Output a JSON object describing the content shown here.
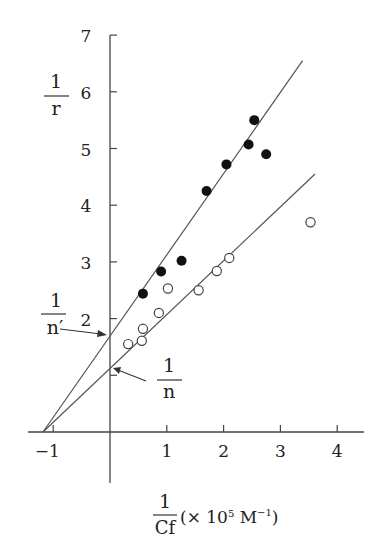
{
  "chart_data": {
    "type": "scatter",
    "title": "",
    "xlabel": "1/Cf (× 10^5 M^-1)",
    "xlabel_parts": {
      "numerator": "1",
      "denominator": "Cf",
      "unit": "(× 10",
      "exp": "5",
      "unit_tail": " M",
      "unit_exp": "−1",
      "close": ")"
    },
    "ylabel": "1/r",
    "ylabel_parts": {
      "numerator": "1",
      "denominator": "r"
    },
    "xlim": [
      -1.3,
      4.5
    ],
    "ylim": [
      0,
      7
    ],
    "x_ticks": [
      -1,
      1,
      2,
      3,
      4
    ],
    "x_tick_labels": [
      "−1",
      "1",
      "2",
      "3",
      "4"
    ],
    "y_ticks": [
      1,
      2,
      3,
      4,
      5,
      6,
      7
    ],
    "y_tick_labels": [
      "",
      "2",
      "3",
      "4",
      "5",
      "6",
      "7"
    ],
    "grid": false,
    "legend": null,
    "series": [
      {
        "name": "filled circles",
        "marker": "filled-circle",
        "points": [
          {
            "x": 0.58,
            "y": 2.44
          },
          {
            "x": 0.9,
            "y": 2.83
          },
          {
            "x": 1.26,
            "y": 3.02
          },
          {
            "x": 1.7,
            "y": 4.25
          },
          {
            "x": 2.05,
            "y": 4.72
          },
          {
            "x": 2.44,
            "y": 5.07
          },
          {
            "x": 2.54,
            "y": 5.5
          },
          {
            "x": 2.75,
            "y": 4.9
          }
        ],
        "fit_line": {
          "x_start": -1.18,
          "y_start": 0,
          "x_end": 3.39,
          "y_end": 6.55,
          "y_intercept": 1.72
        }
      },
      {
        "name": "open circles",
        "marker": "open-circle",
        "points": [
          {
            "x": 0.32,
            "y": 1.55
          },
          {
            "x": 0.56,
            "y": 1.61
          },
          {
            "x": 0.58,
            "y": 1.82
          },
          {
            "x": 0.86,
            "y": 2.1
          },
          {
            "x": 1.02,
            "y": 2.53
          },
          {
            "x": 1.56,
            "y": 2.5
          },
          {
            "x": 1.88,
            "y": 2.84
          },
          {
            "x": 2.1,
            "y": 3.07
          },
          {
            "x": 3.53,
            "y": 3.7
          }
        ],
        "fit_line": {
          "x_start": -1.18,
          "y_start": 0,
          "x_end": 3.61,
          "y_end": 4.55,
          "y_intercept": 1.13
        }
      }
    ],
    "annotations": [
      {
        "text_numerator": "1",
        "text_denominator": "n′",
        "points_to": "upper line y-intercept (1/n′ ≈ 1.72)"
      },
      {
        "text_numerator": "1",
        "text_denominator": "n",
        "points_to": "lower line y-intercept (1/n ≈ 1.13)"
      }
    ]
  }
}
